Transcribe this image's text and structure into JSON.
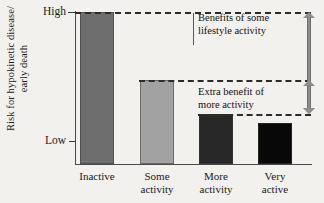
{
  "chart_data": {
    "type": "bar",
    "title": "",
    "xlabel": "",
    "ylabel": "Risk for hypokinetic disease/\nearly death",
    "categories": [
      "Inactive",
      "Some\nactivity",
      "More\nactivity",
      "Very\nactive"
    ],
    "category_labels_flat": [
      "Inactive",
      "Some activity",
      "More activity",
      "Very active"
    ],
    "values": [
      100,
      55,
      33,
      27
    ],
    "ylim": [
      0,
      100
    ],
    "ytick_labels": [
      "High",
      "Low"
    ],
    "ytick_values": [
      100,
      15
    ],
    "grid": false,
    "legend_position": "none",
    "bar_colors": [
      "#6e6e6e",
      "#a2a2a2",
      "#282828",
      "#080808"
    ],
    "plot_background": "#f3f1ed",
    "axis_color": "#4a4a4a",
    "dashed_line_color": "#2b2b2b",
    "arrow_color": "#8e8e8e",
    "reference_lines": [
      {
        "at_value": 100,
        "label": "top of Inactive bar"
      },
      {
        "at_value": 55,
        "label": "top of Some activity bar"
      },
      {
        "at_value": 33,
        "label": "top of More activity bar"
      }
    ],
    "annotations": [
      {
        "text": "Benefits of some\nlifestyle activity",
        "span_from_value": 33,
        "span_to_value": 100,
        "arrow": "double-headed-vertical"
      },
      {
        "text": "Extra benefit of\nmore activity",
        "span_from_value": 33,
        "span_to_value": 55,
        "arrow": "double-headed-vertical"
      }
    ]
  },
  "axes": {
    "ylabel_text": "Risk for hypokinetic disease/\nearly death",
    "ytick_high": "High",
    "ytick_low": "Low"
  },
  "bars": [
    {
      "label": "Inactive",
      "value": 100,
      "color": "#6e6e6e"
    },
    {
      "label": "Some\nactivity",
      "value": 55,
      "color": "#a2a2a2"
    },
    {
      "label": "More\nactivity",
      "value": 33,
      "color": "#282828"
    },
    {
      "label": "Very\nactive",
      "value": 27,
      "color": "#080808"
    }
  ],
  "annotations": {
    "benefits_of_some_lifestyle_activity": "Benefits of some\nlifestyle activity",
    "extra_benefit_of_more_activity": "Extra benefit of\nmore activity"
  }
}
